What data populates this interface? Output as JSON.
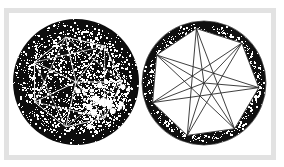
{
  "image": {
    "width": 284,
    "height": 167,
    "background_color": "#ffffff",
    "style": "scanned halftone black-and-white line figure",
    "frame": {
      "border_color": "#e2e2e2",
      "inner_background": "#ffffff",
      "x": 4,
      "y": 8,
      "width": 272,
      "height": 152,
      "border_width": 5
    }
  },
  "figures": [
    {
      "name": "left-disk-figure",
      "label": "left circular figure",
      "description": "Dark speckled disk with faint white inscribed heptagon and radial spokes",
      "center_x": 76,
      "center_y": 82,
      "radius": 63,
      "fill_color": "#0d0d0d",
      "noise_color": "#ffffff",
      "noise_density": 0.34,
      "line_color": "#f2f2f2",
      "line_width": 1.0,
      "polygon_sides": 7,
      "polygon_radius": 46,
      "polygon_rotation_deg": -103,
      "spokes": true,
      "bright_patch": {
        "x": 100,
        "y": 100,
        "radius": 34,
        "intensity": 0.55
      }
    },
    {
      "name": "right-ring-figure",
      "label": "right circular figure",
      "description": "Speckled dark annulus ring with white heptagon interior and thin dark radial spokes",
      "center_x": 204,
      "center_y": 83,
      "radius": 62,
      "fill_color": "#ffffff",
      "ring_color": "#101010",
      "noise_color": "#ffffff",
      "noise_density": 0.3,
      "line_color": "#2a2a2a",
      "line_width": 0.9,
      "polygon_sides": 7,
      "polygon_radius": 55,
      "polygon_rotation_deg": -98,
      "spokes": true
    }
  ],
  "chart_data": {
    "type": "diagram",
    "title": "",
    "shapes": [
      {
        "id": "left",
        "kind": "circle-with-inscribed-polygon",
        "polygon": "heptagon",
        "vertices": 7,
        "center": [
          76,
          82
        ],
        "circle_radius": 63,
        "polygon_radius": 46,
        "rendering": "white lines on black speckled field"
      },
      {
        "id": "right",
        "kind": "annulus-with-inscribed-polygon",
        "polygon": "heptagon",
        "vertices": 7,
        "center": [
          204,
          83
        ],
        "circle_radius": 62,
        "polygon_radius": 55,
        "rendering": "dark lines on white field inside speckled black ring"
      }
    ]
  }
}
